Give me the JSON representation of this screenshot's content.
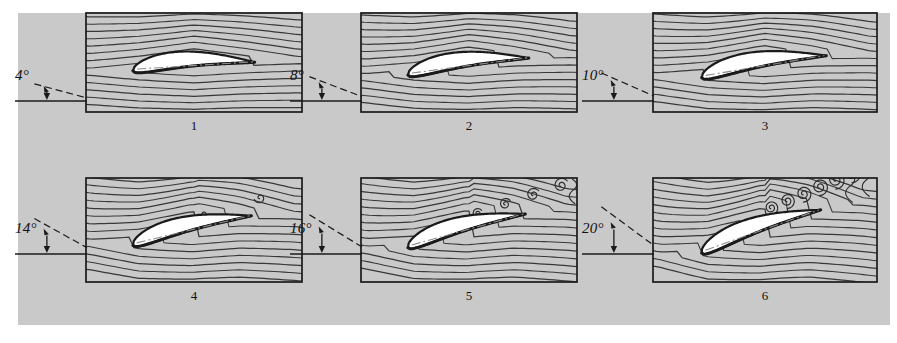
{
  "figure": {
    "background_color": "#c9c9c9",
    "page_color": "#ffffff",
    "ink_color": "#1a1a1a",
    "airfoil_fill": "#ffffff",
    "streamline_color": "#2b2b2b",
    "chord_line_style": "dash-dot",
    "rows": 2,
    "columns": 3
  },
  "panels": [
    {
      "number": "1",
      "angle_label": "4°",
      "angle_deg": 4,
      "flow_state": "attached",
      "vortices": 0,
      "wake": "thin, fully attached flow",
      "x": 85,
      "y": 12,
      "w": 218,
      "h": 101
    },
    {
      "number": "2",
      "angle_label": "8°",
      "angle_deg": 8,
      "flow_state": "attached",
      "vortices": 0,
      "wake": "thin wake, flow still attached",
      "x": 360,
      "y": 12,
      "w": 218,
      "h": 101
    },
    {
      "number": "3",
      "angle_label": "10°",
      "angle_deg": 10,
      "flow_state": "attached",
      "vortices": 0,
      "wake": "slightly thicker wake near trailing edge",
      "x": 652,
      "y": 12,
      "w": 226,
      "h": 101
    },
    {
      "number": "4",
      "angle_label": "14°",
      "angle_deg": 14,
      "flow_state": "incipient separation",
      "vortices": 3,
      "wake": "small vortices forming behind trailing edge",
      "x": 85,
      "y": 177,
      "w": 218,
      "h": 106
    },
    {
      "number": "5",
      "angle_label": "16°",
      "angle_deg": 16,
      "flow_state": "separating",
      "vortices": 5,
      "wake": "separated flow, vortex street over upper surface",
      "x": 360,
      "y": 177,
      "w": 218,
      "h": 106
    },
    {
      "number": "6",
      "angle_label": "20°",
      "angle_deg": 20,
      "flow_state": "fully stalled",
      "vortices": 8,
      "wake": "large scale vortex shedding, full stall",
      "x": 652,
      "y": 177,
      "w": 226,
      "h": 106
    }
  ],
  "chart_data": {
    "type": "line",
    "xlabel": "",
    "ylabel": "",
    "categories": [
      "1",
      "2",
      "3",
      "4",
      "5",
      "6"
    ],
    "series": [
      {
        "name": "Angle of attack (degrees)",
        "values": [
          4,
          8,
          10,
          14,
          16,
          20
        ]
      },
      {
        "name": "Number of visible vortices in wake",
        "values": [
          0,
          0,
          0,
          3,
          5,
          8
        ]
      }
    ],
    "annotations": [
      "4° — attached flow",
      "8° — attached flow",
      "10° — attached flow",
      "14° — incipient separation",
      "16° — separating flow",
      "20° — fully stalled"
    ],
    "grid": false,
    "legend_position": "none"
  }
}
